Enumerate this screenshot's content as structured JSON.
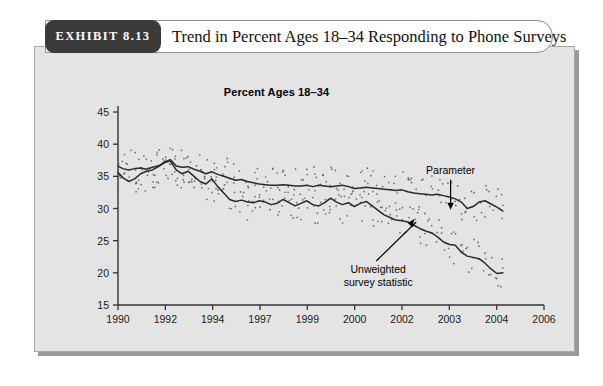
{
  "exhibit": {
    "tab_label": "EXHIBIT 8.13",
    "title": "Trend in Percent Ages 18–34 Responding to Phone Surveys"
  },
  "colors": {
    "panel_bg": "#e4e4e4",
    "tab_bg": "#3a3a3a",
    "line": "#2a2a2a",
    "point": "#555555",
    "axis": "#333333",
    "page_bg": "#ffffff"
  },
  "chart_data": {
    "type": "line",
    "title": "Percent Ages 18–34",
    "xlabel": "",
    "ylabel": "",
    "grid": false,
    "legend_position": "annotations",
    "xlim": [
      1990,
      2006.5
    ],
    "ylim": [
      15,
      45
    ],
    "yticks": [
      15,
      20,
      25,
      30,
      35,
      40,
      45
    ],
    "ytick_labels": [
      "15",
      "20",
      "25",
      "30",
      "35",
      "40",
      "45"
    ],
    "xticks": [
      1990,
      1992,
      1994,
      1997,
      1999,
      2000,
      2002,
      2003,
      2004,
      2006
    ],
    "xtick_labels": [
      "1990",
      "1992",
      "1994",
      "1997",
      "1999",
      "2000",
      "2002",
      "2003",
      "2004",
      "2006"
    ],
    "annotations": [
      {
        "text": "Parameter",
        "target_series": "Parameter",
        "x": 2004.0,
        "y": 29.5
      },
      {
        "text": "Unweighted survey statistic",
        "target_series": "Unweighted survey statistic",
        "x": 2002.3,
        "y": 26.5
      }
    ],
    "series": [
      {
        "name": "Parameter",
        "style": "solid-line",
        "x": [
          1990.0,
          1990.2,
          1990.45,
          1990.7,
          1990.95,
          1991.2,
          1991.45,
          1991.7,
          1991.95,
          1992.2,
          1992.45,
          1992.7,
          1992.95,
          1993.2,
          1993.45,
          1993.7,
          1993.95,
          1994.2,
          1994.45,
          1994.7,
          1994.95,
          1995.2,
          1995.45,
          1995.7,
          1995.95,
          1996.2,
          1996.45,
          1996.7,
          1996.95,
          1997.2,
          1997.45,
          1997.7,
          1997.95,
          1998.2,
          1998.45,
          1998.7,
          1998.95,
          1999.2,
          1999.45,
          1999.7,
          1999.95,
          2000.2,
          2000.45,
          2000.7,
          2000.95,
          2001.2,
          2001.45,
          2001.7,
          2001.95,
          2002.2,
          2002.45,
          2002.7,
          2002.95,
          2003.2,
          2003.45,
          2003.7,
          2003.95,
          2004.2,
          2004.45,
          2004.7,
          2004.95,
          2005.2,
          2005.45,
          2005.7,
          2005.95,
          2006.2
        ],
        "y": [
          36.6,
          36.2,
          36.0,
          36.2,
          36.3,
          36.1,
          36.4,
          36.6,
          37.2,
          37.6,
          36.6,
          36.4,
          36.5,
          36.1,
          35.8,
          35.4,
          35.7,
          35.3,
          35.0,
          34.7,
          34.4,
          34.5,
          34.2,
          34.0,
          33.8,
          33.7,
          33.6,
          33.6,
          33.7,
          33.6,
          33.5,
          33.5,
          33.6,
          33.4,
          33.6,
          33.5,
          33.4,
          33.5,
          33.6,
          33.4,
          33.1,
          33.2,
          33.3,
          33.2,
          33.1,
          33.0,
          32.9,
          32.8,
          32.9,
          32.6,
          32.4,
          32.3,
          32.2,
          32.1,
          32.2,
          32.0,
          31.8,
          31.5,
          31.0,
          30.0,
          30.3,
          31.0,
          31.2,
          30.7,
          30.2,
          29.6
        ]
      },
      {
        "name": "Unweighted survey statistic",
        "style": "solid-line",
        "x": [
          1990.0,
          1990.2,
          1990.45,
          1990.7,
          1990.95,
          1991.2,
          1991.45,
          1991.7,
          1991.95,
          1992.2,
          1992.45,
          1992.7,
          1992.95,
          1993.2,
          1993.45,
          1993.7,
          1993.95,
          1994.2,
          1994.45,
          1994.7,
          1994.95,
          1995.2,
          1995.45,
          1995.7,
          1995.95,
          1996.2,
          1996.45,
          1996.7,
          1996.95,
          1997.2,
          1997.45,
          1997.7,
          1997.95,
          1998.2,
          1998.45,
          1998.7,
          1998.95,
          1999.2,
          1999.45,
          1999.7,
          1999.95,
          2000.2,
          2000.45,
          2000.7,
          2000.95,
          2001.2,
          2001.45,
          2001.7,
          2001.95,
          2002.2,
          2002.45,
          2002.7,
          2002.95,
          2003.2,
          2003.45,
          2003.7,
          2003.95,
          2004.2,
          2004.45,
          2004.7,
          2004.95,
          2005.2,
          2005.45,
          2005.7,
          2005.95,
          2006.2
        ],
        "y": [
          35.6,
          34.8,
          34.2,
          34.6,
          35.4,
          35.8,
          36.0,
          36.5,
          37.1,
          37.4,
          36.0,
          35.4,
          35.8,
          35.0,
          34.2,
          33.8,
          34.6,
          33.4,
          32.4,
          31.4,
          31.1,
          31.3,
          31.0,
          30.9,
          31.2,
          31.0,
          30.6,
          30.8,
          31.4,
          30.9,
          30.4,
          30.8,
          31.2,
          30.6,
          30.4,
          30.9,
          31.6,
          31.0,
          30.6,
          30.9,
          30.3,
          30.8,
          31.1,
          30.4,
          29.7,
          29.0,
          28.6,
          28.2,
          28.1,
          27.9,
          27.4,
          26.9,
          26.5,
          26.2,
          25.6,
          24.8,
          24.4,
          24.3,
          23.2,
          22.6,
          22.4,
          22.2,
          21.5,
          20.6,
          19.9,
          20.0
        ]
      }
    ],
    "scatter_note": "individual survey observations shown as small dots around both curves"
  }
}
